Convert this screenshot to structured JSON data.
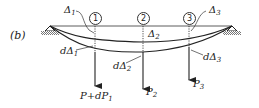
{
  "figure": {
    "panel_label": "(b)",
    "nodes": [
      {
        "id": "node-1",
        "label": "1",
        "x": 95
      },
      {
        "id": "node-2",
        "label": "2",
        "x": 143
      },
      {
        "id": "node-3",
        "label": "3",
        "x": 189
      }
    ],
    "deflections": [
      {
        "symbol": "Δ",
        "sub": "1"
      },
      {
        "symbol": "Δ",
        "sub": "2"
      },
      {
        "symbol": "Δ",
        "sub": "3"
      }
    ],
    "incremental_deflections": [
      {
        "prefix": "dΔ",
        "sub": "1"
      },
      {
        "prefix": "dΔ",
        "sub": "2"
      },
      {
        "prefix": "dΔ",
        "sub": "3"
      }
    ],
    "loads": [
      {
        "main": "P+dP",
        "sub": "1"
      },
      {
        "main": "P",
        "sub": "2"
      },
      {
        "main": "P",
        "sub": "3"
      }
    ],
    "colors": {
      "line": "#222222",
      "hatch": "#777777",
      "background": "#ffffff"
    }
  }
}
